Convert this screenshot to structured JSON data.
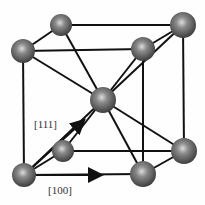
{
  "diagram": {
    "type": "bcc-unit-cell",
    "labels": {
      "dir_111": "[111]",
      "dir_100": "[100]"
    },
    "colors": {
      "line": "#111111",
      "atom_dark": "#4a4a4a",
      "atom_light": "#e8e8e8",
      "background": "#fefefe"
    }
  }
}
